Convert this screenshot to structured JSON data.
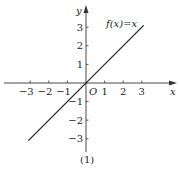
{
  "chart_data": {
    "type": "line",
    "title": "",
    "caption": "(1)",
    "xlabel": "x",
    "ylabel": "y",
    "origin_label": "O",
    "function_label": "f(x)=x",
    "series": [
      {
        "name": "f(x)=x",
        "x": [
          -3.1,
          3.1
        ],
        "y": [
          -3.1,
          3.1
        ]
      }
    ],
    "x_ticks": [
      -3,
      -2,
      -1,
      1,
      2,
      3
    ],
    "x_tick_labels": [
      "−3",
      "−2",
      "−1",
      "1",
      "2",
      "3"
    ],
    "y_ticks": [
      -3,
      -2,
      -1,
      1,
      2,
      3
    ],
    "y_tick_labels": [
      "−3",
      "−2",
      "−1",
      "1",
      "2",
      "3"
    ],
    "xlim": [
      -4.5,
      4.9
    ],
    "ylim": [
      -4.4,
      4.3
    ],
    "grid": false,
    "legend": "none",
    "line_color": "#222222",
    "axis_color": "#333333"
  }
}
